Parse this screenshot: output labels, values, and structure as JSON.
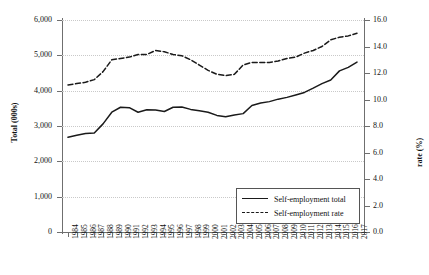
{
  "chart_data": {
    "type": "line",
    "title": "",
    "xlabel": "",
    "ylabel": "Total (000s)",
    "y2label": "rate (%)",
    "grid": true,
    "legend_position": "lower-right",
    "x": [
      1984,
      1985,
      1986,
      1987,
      1988,
      1989,
      1990,
      1991,
      1992,
      1993,
      1994,
      1995,
      1996,
      1997,
      1998,
      1999,
      2000,
      2001,
      2002,
      2003,
      2004,
      2005,
      2006,
      2007,
      2008,
      2009,
      2010,
      2011,
      2012,
      2013,
      2014,
      2015,
      2016,
      2017
    ],
    "xtick_labels": [
      "1984",
      "1985",
      "1986",
      "1987",
      "1988",
      "1989",
      "1990",
      "1991",
      "1992",
      "1993",
      "1994",
      "1995",
      "1996",
      "1997",
      "1998",
      "1999",
      "2000",
      "2001",
      "2002",
      "2003",
      "2004",
      "2005",
      "2006",
      "2007",
      "2008",
      "2009",
      "2010",
      "2011",
      "2012",
      "2013",
      "2014",
      "2015",
      "2016",
      "2017"
    ],
    "ylim": [
      0,
      6000
    ],
    "yticks": [
      0,
      1000,
      2000,
      3000,
      4000,
      5000,
      6000
    ],
    "ytick_labels": [
      "0",
      "1,000",
      "2,000",
      "3,000",
      "4,000",
      "5,000",
      "6,000"
    ],
    "y2lim": [
      0.0,
      16.0
    ],
    "y2ticks": [
      0.0,
      2.0,
      4.0,
      6.0,
      8.0,
      10.0,
      12.0,
      14.0,
      16.0
    ],
    "y2tick_labels": [
      "0.0",
      "2.0",
      "4.0",
      "6.0",
      "8.0",
      "10.0",
      "12.0",
      "14.0",
      "16.0"
    ],
    "series": [
      {
        "name": "Self-employment total",
        "axis": "left",
        "style": "solid",
        "color": "#1a1a1a",
        "values": [
          2680,
          2740,
          2790,
          2800,
          3060,
          3390,
          3530,
          3520,
          3390,
          3460,
          3450,
          3410,
          3530,
          3540,
          3470,
          3430,
          3390,
          3300,
          3260,
          3310,
          3350,
          3580,
          3650,
          3690,
          3760,
          3810,
          3880,
          3950,
          4070,
          4200,
          4300,
          4560,
          4660,
          4810
        ]
      },
      {
        "name": "Self-employment rate",
        "axis": "right",
        "style": "dashed",
        "color": "#1a1a1a",
        "values": [
          11.1,
          11.2,
          11.3,
          11.5,
          12.1,
          13.0,
          13.1,
          13.2,
          13.4,
          13.4,
          13.7,
          13.6,
          13.4,
          13.3,
          13.0,
          12.6,
          12.2,
          11.9,
          11.8,
          11.9,
          12.6,
          12.8,
          12.8,
          12.8,
          12.9,
          13.1,
          13.2,
          13.5,
          13.7,
          14.0,
          14.5,
          14.7,
          14.8,
          15.0
        ]
      }
    ]
  },
  "legend": {
    "items": [
      {
        "label": "Self-employment total",
        "style": "solid"
      },
      {
        "label": "Self-employment rate",
        "style": "dashed"
      }
    ]
  }
}
